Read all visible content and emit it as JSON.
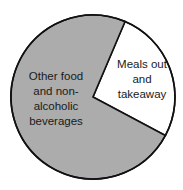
{
  "chart_data": {
    "type": "pie",
    "title": "",
    "slices": [
      {
        "label": "Meals out and takeaway",
        "value": 26,
        "color": "#ffffff",
        "start_angle_deg": 23,
        "end_angle_deg": 118
      },
      {
        "label": "Other food and non-alcoholic beverages",
        "value": 74,
        "color": "#acacac",
        "start_angle_deg": 118,
        "end_angle_deg": 383
      }
    ],
    "legend": "none",
    "labels_inside": true,
    "outline_color": "#111111"
  },
  "labels": {
    "grey": "Other food\nand non-\nalcoholic\nbeverages",
    "white": "Meals out\nand\ntakeaway"
  },
  "geometry": {
    "cx": 93,
    "cy": 97,
    "r": 82
  }
}
